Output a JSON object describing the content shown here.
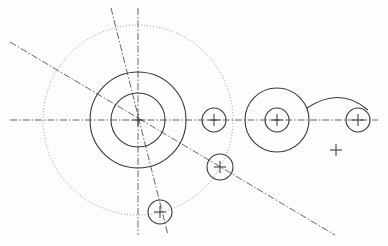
{
  "drawing": {
    "type": "2D CAD sketch",
    "colors": {
      "background": "#fdfdfd",
      "object_line": "#3a3a3a",
      "center_line": "#555555",
      "construction_line": "#8a8a8a"
    },
    "center_lines": [
      {
        "id": "horizontal-axis",
        "x1": 10,
        "y1": 120,
        "x2": 378,
        "y2": 120
      },
      {
        "id": "vertical-axis",
        "x1": 138,
        "y1": 8,
        "x2": 138,
        "y2": 235
      },
      {
        "id": "angled-axis",
        "x1": 111,
        "y1": 8,
        "x2": 168,
        "y2": 235
      },
      {
        "id": "diagonal-axis",
        "x1": 10,
        "y1": 42,
        "x2": 335,
        "y2": 235
      }
    ],
    "construction_circles": [
      {
        "id": "bolt-circle",
        "cx": 138,
        "cy": 120,
        "r": 95
      }
    ],
    "circles": [
      {
        "id": "main-outer",
        "cx": 138,
        "cy": 120,
        "r": 48
      },
      {
        "id": "main-inner",
        "cx": 138,
        "cy": 120,
        "r": 27
      },
      {
        "id": "hole-right-of-main",
        "cx": 214,
        "cy": 120,
        "r": 12
      },
      {
        "id": "boss-outer",
        "cx": 277,
        "cy": 120,
        "r": 32
      },
      {
        "id": "boss-inner",
        "cx": 277,
        "cy": 120,
        "r": 12
      },
      {
        "id": "hole-far-right",
        "cx": 358,
        "cy": 120,
        "r": 12
      },
      {
        "id": "hole-diagonal",
        "cx": 220,
        "cy": 167,
        "r": 13
      },
      {
        "id": "hole-angled",
        "cx": 160,
        "cy": 212,
        "r": 12
      }
    ],
    "arcs": [
      {
        "id": "connecting-arc",
        "d": "M 307 108 Q 340 86 368 110"
      }
    ],
    "center_marks": [
      {
        "id": "mark-main",
        "x": 138,
        "y": 120,
        "size": 6
      },
      {
        "id": "mark-hole-right",
        "x": 214,
        "y": 120,
        "size": 6
      },
      {
        "id": "mark-boss",
        "x": 277,
        "y": 120,
        "size": 6
      },
      {
        "id": "mark-far-right",
        "x": 358,
        "y": 120,
        "size": 6
      },
      {
        "id": "mark-diagonal",
        "x": 220,
        "y": 167,
        "size": 6
      },
      {
        "id": "mark-angled",
        "x": 160,
        "y": 212,
        "size": 6
      },
      {
        "id": "mark-lone",
        "x": 336,
        "y": 150,
        "size": 6
      }
    ]
  }
}
